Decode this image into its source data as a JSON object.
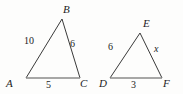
{
  "figure": {
    "background_color": "#fdfdfc",
    "stroke_color": "#3a3a3a",
    "base_stroke_color": "#8a8a8a",
    "text_color": "#1c1c1c",
    "width": 183,
    "height": 94
  },
  "diagram_data": {
    "type": "geometry-similar-triangles",
    "shapes": [
      {
        "name": "triangle-abc",
        "vertices": [
          {
            "label": "A",
            "x": 26,
            "y": 78
          },
          {
            "label": "B",
            "x": 62,
            "y": 19
          },
          {
            "label": "C",
            "x": 80,
            "y": 78
          }
        ],
        "sides": [
          {
            "name": "AB",
            "label": "10"
          },
          {
            "name": "BC",
            "label": "6"
          },
          {
            "name": "AC",
            "label": "5"
          }
        ]
      },
      {
        "name": "triangle-def",
        "vertices": [
          {
            "label": "D",
            "x": 110,
            "y": 78
          },
          {
            "label": "E",
            "x": 140,
            "y": 33
          },
          {
            "label": "F",
            "x": 162,
            "y": 78
          }
        ],
        "sides": [
          {
            "name": "DE",
            "label": "6"
          },
          {
            "name": "EF",
            "label": "x"
          },
          {
            "name": "DF",
            "label": "3"
          }
        ]
      }
    ]
  },
  "left_triangle": {
    "vertex_a": "A",
    "vertex_b": "B",
    "vertex_c": "C",
    "side_ab": "10",
    "side_bc": "6",
    "side_ac": "5"
  },
  "right_triangle": {
    "vertex_d": "D",
    "vertex_e": "E",
    "vertex_f": "F",
    "side_de": "6",
    "side_ef": "x",
    "side_df": "3"
  }
}
